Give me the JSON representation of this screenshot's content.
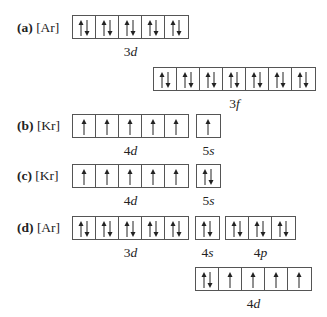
{
  "problems": [
    {
      "id": "a",
      "tag": "(a)",
      "core": "[Ar]",
      "label_pos": {
        "x": 17,
        "y": 20
      },
      "groups": [
        {
          "name": "3d",
          "num": "3",
          "letter": "d",
          "x": 72,
          "y": 15,
          "cells": [
            "ud",
            "ud",
            "ud",
            "ud",
            "ud"
          ],
          "label_y": 44
        },
        {
          "name": "3f",
          "num": "3",
          "letter": "f",
          "x": 153,
          "y": 67,
          "cells": [
            "ud",
            "ud",
            "ud",
            "ud",
            "ud",
            "ud",
            "ud"
          ],
          "label_y": 96
        }
      ]
    },
    {
      "id": "b",
      "tag": "(b)",
      "core": "[Kr]",
      "label_pos": {
        "x": 17,
        "y": 118
      },
      "groups": [
        {
          "name": "4d",
          "num": "4",
          "letter": "d",
          "x": 72,
          "y": 114,
          "cells": [
            "u",
            "u",
            "u",
            "u",
            "u"
          ],
          "label_y": 143
        },
        {
          "name": "5s",
          "num": "5",
          "letter": "s",
          "x": 196,
          "y": 114,
          "cells": [
            "u"
          ],
          "label_y": 143
        }
      ]
    },
    {
      "id": "c",
      "tag": "(c)",
      "core": "[Kr]",
      "label_pos": {
        "x": 17,
        "y": 168
      },
      "groups": [
        {
          "name": "4d",
          "num": "4",
          "letter": "d",
          "x": 72,
          "y": 164,
          "cells": [
            "u",
            "u",
            "u",
            "u",
            "u"
          ],
          "label_y": 193
        },
        {
          "name": "5s",
          "num": "5",
          "letter": "s",
          "x": 196,
          "y": 164,
          "cells": [
            "ud"
          ],
          "label_y": 193
        }
      ]
    },
    {
      "id": "d",
      "tag": "(d)",
      "core": "[Ar]",
      "label_pos": {
        "x": 17,
        "y": 220
      },
      "groups": [
        {
          "name": "3d",
          "num": "3",
          "letter": "d",
          "x": 72,
          "y": 216,
          "cells": [
            "ud",
            "ud",
            "ud",
            "ud",
            "ud"
          ],
          "label_y": 245
        },
        {
          "name": "4s",
          "num": "4",
          "letter": "s",
          "x": 195,
          "y": 216,
          "cells": [
            "ud"
          ],
          "label_y": 245
        },
        {
          "name": "4p",
          "num": "4",
          "letter": "p",
          "x": 225,
          "y": 216,
          "cells": [
            "ud",
            "ud",
            "ud"
          ],
          "label_y": 245
        },
        {
          "name": "4d",
          "num": "4",
          "letter": "d",
          "x": 195,
          "y": 267,
          "cells": [
            "ud",
            "u",
            "u",
            "u",
            "u"
          ],
          "label_y": 296
        }
      ]
    }
  ]
}
